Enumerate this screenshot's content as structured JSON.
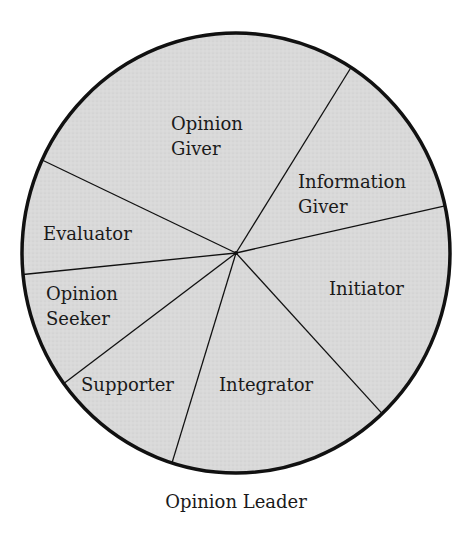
{
  "chart_data": {
    "type": "pie",
    "title": "",
    "caption": "Opinion Leader",
    "values_source": "estimated from slice geometry; no values are printed in the image",
    "legend": "none (labels drawn inside slices)",
    "grid": false,
    "start_angle_deg": -57.5,
    "direction": "clockwise",
    "slices": [
      {
        "label": "Information Giver",
        "lines": [
          "Information",
          "Giver"
        ],
        "value": 12.5,
        "angle_deg": 45.1,
        "label_x": 298,
        "label_y": 188
      },
      {
        "label": "Initiator",
        "lines": [
          "Initiator"
        ],
        "value": 16.5,
        "angle_deg": 59.3,
        "label_x": 329,
        "label_y": 295
      },
      {
        "label": "Integrator",
        "lines": [
          "Integrator"
        ],
        "value": 16.8,
        "angle_deg": 60.5,
        "label_x": 219,
        "label_y": 391
      },
      {
        "label": "Supporter",
        "lines": [
          "Supporter"
        ],
        "value": 10.1,
        "angle_deg": 36.2,
        "label_x": 81,
        "label_y": 391
      },
      {
        "label": "Opinion Seeker",
        "lines": [
          "Opinion",
          "Seeker"
        ],
        "value": 8.6,
        "angle_deg": 30.8,
        "label_x": 46,
        "label_y": 300
      },
      {
        "label": "Evaluator",
        "lines": [
          "Evaluator"
        ],
        "value": 8.5,
        "angle_deg": 30.6,
        "label_x": 43,
        "label_y": 240
      },
      {
        "label": "Opinion Giver",
        "lines": [
          "Opinion",
          "Giver"
        ],
        "value": 27.1,
        "angle_deg": 97.5,
        "label_x": 171,
        "label_y": 130
      }
    ],
    "categories": [
      "Information Giver",
      "Initiator",
      "Integrator",
      "Supporter",
      "Opinion Seeker",
      "Evaluator",
      "Opinion Giver"
    ],
    "values": [
      12.5,
      16.5,
      16.8,
      10.1,
      8.6,
      8.5,
      27.1
    ]
  },
  "style": {
    "fill_color": "#d9d9d9",
    "stroke_color": "#111111",
    "text_color": "#1a1a1a",
    "background": "#ffffff"
  },
  "geometry": {
    "cx": 236,
    "cy": 253,
    "rx": 214,
    "ry": 220,
    "line_height": 25
  }
}
